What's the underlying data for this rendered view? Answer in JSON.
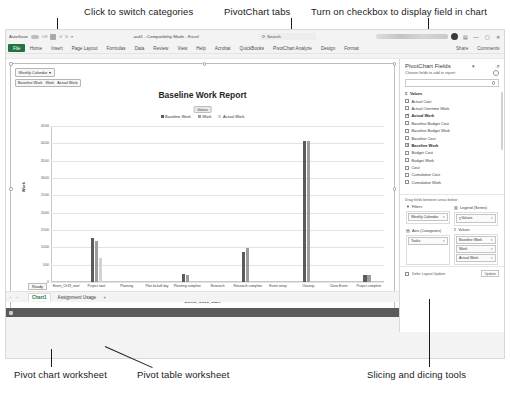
{
  "annotations": {
    "top": [
      {
        "text": "Click to switch categories"
      },
      {
        "text": "PivotChart tabs"
      },
      {
        "text": "Turn on checkbox to display field in chart"
      }
    ],
    "bottom": [
      {
        "text": "Pivot chart worksheet"
      },
      {
        "text": "Pivot table worksheet"
      },
      {
        "text": "Slicing and dicing tools"
      }
    ]
  },
  "window": {
    "autosave_label": "AutoSave",
    "autosave_state": "Off",
    "title": "asd1 - Compatibility Mode - Excel",
    "search_placeholder": "Search",
    "share_label": "Share",
    "comments_label": "Comments",
    "ribbon_tabs": [
      "File",
      "Home",
      "Insert",
      "Page Layout",
      "Formulas",
      "Data",
      "Review",
      "View",
      "Help",
      "Acrobat",
      "QuickBooks",
      "PivotChart Analyze",
      "Design",
      "Format"
    ]
  },
  "chart_controls": {
    "filter_button": "Weekly Calendar",
    "filter_caret": "▾",
    "series_buttons": [
      "Baseline Work",
      "Work",
      "Actual Work"
    ],
    "values_button": "Values"
  },
  "chart_data": {
    "type": "bar",
    "title": "Baseline Work Report",
    "xlabel": "Event_Ch19_start",
    "ylabel": "Work",
    "ylim": [
      0,
      4500
    ],
    "yticks": [
      0,
      500,
      1000,
      1500,
      2000,
      2500,
      3000,
      3500,
      4000,
      4500
    ],
    "grid": true,
    "legend_position": "top",
    "categories": [
      "Event_Ch19_start",
      "Project start",
      "Planning",
      "Plan kickoff day",
      "Planning complete",
      "Research",
      "Research complete",
      "Event setup",
      "Cleanup",
      "Close Event",
      "Project complete"
    ],
    "series": [
      {
        "name": "Baseline Work",
        "color": "#5b5b5b",
        "values": [
          0,
          1280,
          0,
          0,
          220,
          0,
          880,
          0,
          4080,
          0,
          190
        ]
      },
      {
        "name": "Work",
        "color": "#9d9d9d",
        "values": [
          0,
          1190,
          0,
          0,
          195,
          0,
          985,
          0,
          4080,
          0,
          215
        ]
      },
      {
        "name": "Actual Work",
        "color": "#d2d2d2",
        "values": [
          0,
          700,
          0,
          0,
          0,
          0,
          0,
          0,
          0,
          0,
          0
        ]
      }
    ]
  },
  "sheet": {
    "ready_label": "Ready",
    "tabs": [
      {
        "label": "Chart1",
        "active": true
      },
      {
        "label": "Assignment Usage",
        "active": false
      }
    ],
    "add_sheet": "+",
    "zoom_level": "100%"
  },
  "pane": {
    "title": "PivotChart Fields",
    "subtitle": "Choose fields to add to report:",
    "search_placeholder": "",
    "fields": [
      {
        "label": "Values",
        "checked": false,
        "group": true
      },
      {
        "label": "Actual Cost",
        "checked": false
      },
      {
        "label": "Actual Overtime Work",
        "checked": false
      },
      {
        "label": "Actual Work",
        "checked": true
      },
      {
        "label": "Baseline Budget Cost",
        "checked": false
      },
      {
        "label": "Baseline Budget Work",
        "checked": false
      },
      {
        "label": "Baseline Cost",
        "checked": false
      },
      {
        "label": "Baseline Work",
        "checked": true
      },
      {
        "label": "Budget Cost",
        "checked": false
      },
      {
        "label": "Budget Work",
        "checked": false
      },
      {
        "label": "Cost",
        "checked": false
      },
      {
        "label": "Cumulative Cost",
        "checked": false
      },
      {
        "label": "Cumulative Work",
        "checked": false
      }
    ],
    "areas_hint": "Drag fields between areas below:",
    "areas": {
      "filters": {
        "label": "Filters",
        "items": [
          "Weekly Calendar"
        ]
      },
      "legend": {
        "label": "Legend (Series)",
        "items": [
          "Values"
        ]
      },
      "axis": {
        "label": "Axis (Categories)",
        "items": [
          "Tasks"
        ]
      },
      "values": {
        "label": "Values",
        "items": [
          "Baseline Work",
          "Work",
          "Actual Work"
        ]
      }
    },
    "defer_label": "Defer Layout Update",
    "update_label": "Update"
  }
}
